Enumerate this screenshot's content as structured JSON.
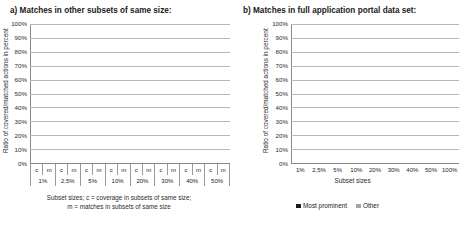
{
  "panels": {
    "a": {
      "title": "a) Matches in other subsets of same size:",
      "ylabel": "Ratio of covered/matched actions in percent",
      "caption_line1": "Subset sizes; c = coverage in subsets of same size;",
      "caption_line2": "m = matches in subsets of same size"
    },
    "b": {
      "title": "b) Matches in full application portal data set:",
      "ylabel": "Ratio of covered/matched actions in percent",
      "xlabel": "Subset sizes"
    }
  },
  "legend": {
    "items": [
      {
        "label": "Most prominent",
        "color": "#1a1a1a"
      },
      {
        "label": "Other",
        "color": "#a6a6a6"
      }
    ]
  },
  "yticks": [
    "100%",
    "90%",
    "80%",
    "70%",
    "60%",
    "50%",
    "40%",
    "30%",
    "20%",
    "10%",
    "0%"
  ],
  "sub_labels": [
    "c",
    "m"
  ],
  "chart_data": [
    {
      "type": "bar",
      "id": "a",
      "title": "a) Matches in other subsets of same size:",
      "subtitle": "Subset sizes; c = coverage in subsets of same size; m = matches in subsets of same size",
      "xlabel": "Subset sizes",
      "ylabel": "Ratio of covered/matched actions in percent",
      "ylim": [
        0,
        100
      ],
      "ytick_step": 10,
      "grid": true,
      "stacked": true,
      "legend": [
        "Most prominent",
        "Other"
      ],
      "legend_position": "bottom",
      "categories": [
        "1%",
        "2,5%",
        "5%",
        "10%",
        "20%",
        "30%",
        "40%",
        "50%"
      ],
      "subcategories": [
        "c",
        "m"
      ],
      "series": [
        {
          "name": "Most prominent",
          "color": "#1a1a1a",
          "values_c": [
            46,
            55,
            63,
            69,
            75,
            77,
            79,
            80
          ],
          "values_m": [
            39,
            53,
            61,
            70,
            77,
            81,
            83,
            85
          ]
        },
        {
          "name": "Other",
          "color": "#a6a6a6",
          "values_c": [
            32,
            28,
            23,
            19,
            15,
            15,
            14,
            13
          ],
          "values_m": [
            24,
            22,
            21,
            16,
            13,
            12,
            11,
            10
          ]
        }
      ],
      "totals_c": [
        78,
        83,
        86,
        88,
        90,
        92,
        93,
        93
      ],
      "totals_m": [
        63,
        75,
        82,
        86,
        90,
        93,
        94,
        95
      ]
    },
    {
      "type": "bar",
      "id": "b",
      "title": "b) Matches in full application portal data set:",
      "xlabel": "Subset sizes",
      "ylabel": "Ratio of covered/matched actions in percent",
      "ylim": [
        0,
        100
      ],
      "ytick_step": 10,
      "grid": true,
      "stacked": true,
      "legend": [
        "Most prominent",
        "Other"
      ],
      "legend_position": "bottom",
      "categories": [
        "1%",
        "2,5%",
        "5%",
        "10%",
        "20%",
        "30%",
        "40%",
        "50%",
        "100%"
      ],
      "series": [
        {
          "name": "Most prominent",
          "color": "#1a1a1a",
          "values": [
            39,
            53,
            61,
            70,
            77,
            81,
            83,
            85,
            86
          ]
        },
        {
          "name": "Other",
          "color": "#a6a6a6",
          "values": [
            24,
            22,
            21,
            17,
            14,
            12,
            11,
            10,
            9
          ]
        }
      ],
      "totals": [
        63,
        75,
        82,
        87,
        91,
        93,
        94,
        95,
        95
      ]
    }
  ]
}
